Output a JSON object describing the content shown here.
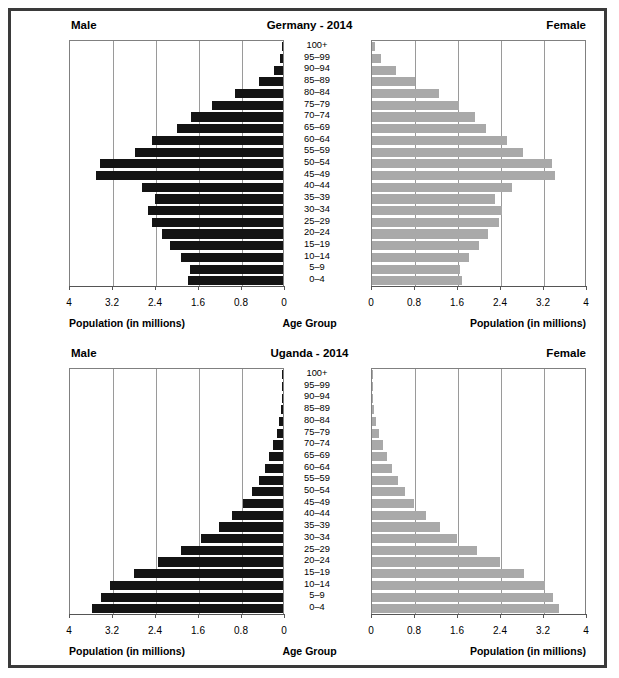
{
  "figure": {
    "border_color": "#3a3a3a",
    "male_color": "#141414",
    "female_color": "#a9a9a9"
  },
  "labels": {
    "male": "Male",
    "female": "Female",
    "age_group": "Age Group",
    "population_axis": "Population (in millions)"
  },
  "age_groups": [
    "100+",
    "95–99",
    "90–94",
    "85–89",
    "80–84",
    "75–79",
    "70–74",
    "65–69",
    "60–64",
    "55–59",
    "50–54",
    "45–49",
    "40–44",
    "35–39",
    "30–34",
    "25–29",
    "20–24",
    "15–19",
    "10–14",
    "5–9",
    "0–4"
  ],
  "ticks_left": [
    "4",
    "3.2",
    "2.4",
    "1.6",
    "0.8",
    "0"
  ],
  "ticks_right": [
    "0",
    "0.8",
    "1.6",
    "2.4",
    "3.2",
    "4"
  ],
  "chart_data": [
    {
      "type": "bar",
      "subtype": "population-pyramid",
      "title": "Germany - 2014",
      "xlabel": "Population (in millions)",
      "ylabel": "Age Group",
      "xlim": [
        0,
        4
      ],
      "xticks": [
        0,
        0.8,
        1.6,
        2.4,
        3.2,
        4
      ],
      "grid": true,
      "legend": [
        "Male",
        "Female"
      ],
      "legend_position": "top-left and top-right",
      "categories": [
        "100+",
        "95–99",
        "90–94",
        "85–89",
        "80–84",
        "75–79",
        "70–74",
        "65–69",
        "60–64",
        "55–59",
        "50–54",
        "45–49",
        "40–44",
        "35–39",
        "30–34",
        "25–29",
        "20–24",
        "15–19",
        "10–14",
        "5–9",
        "0–4"
      ],
      "series": [
        {
          "name": "Male",
          "side": "left",
          "values": [
            0.01,
            0.05,
            0.17,
            0.45,
            0.9,
            1.32,
            1.72,
            1.97,
            2.43,
            2.76,
            3.4,
            3.48,
            2.63,
            2.39,
            2.52,
            2.44,
            2.26,
            2.1,
            1.9,
            1.73,
            1.77
          ]
        },
        {
          "name": "Female",
          "side": "right",
          "values": [
            0.05,
            0.17,
            0.45,
            0.8,
            1.25,
            1.62,
            1.92,
            2.12,
            2.51,
            2.8,
            3.35,
            3.4,
            2.6,
            2.28,
            2.42,
            2.37,
            2.16,
            1.99,
            1.8,
            1.63,
            1.67
          ]
        }
      ]
    },
    {
      "type": "bar",
      "subtype": "population-pyramid",
      "title": "Uganda - 2014",
      "xlabel": "Population (in millions)",
      "ylabel": "Age Group",
      "xlim": [
        0,
        4
      ],
      "xticks": [
        0,
        0.8,
        1.6,
        2.4,
        3.2,
        4
      ],
      "grid": true,
      "legend": [
        "Male",
        "Female"
      ],
      "legend_position": "top-left and top-right",
      "categories": [
        "100+",
        "95–99",
        "90–94",
        "85–89",
        "80–84",
        "75–79",
        "70–74",
        "65–69",
        "60–64",
        "55–59",
        "50–54",
        "45–49",
        "40–44",
        "35–39",
        "30–34",
        "25–29",
        "20–24",
        "15–19",
        "10–14",
        "5–9",
        "0–4"
      ],
      "series": [
        {
          "name": "Male",
          "side": "left",
          "values": [
            0.004,
            0.008,
            0.02,
            0.04,
            0.07,
            0.12,
            0.18,
            0.26,
            0.34,
            0.45,
            0.58,
            0.74,
            0.95,
            1.2,
            1.52,
            1.9,
            2.33,
            2.78,
            3.22,
            3.38,
            3.55
          ]
        },
        {
          "name": "Female",
          "side": "right",
          "values": [
            0.004,
            0.008,
            0.02,
            0.04,
            0.08,
            0.13,
            0.2,
            0.28,
            0.37,
            0.48,
            0.62,
            0.79,
            1.0,
            1.26,
            1.58,
            1.96,
            2.38,
            2.82,
            3.22,
            3.36,
            3.47
          ]
        }
      ]
    }
  ]
}
